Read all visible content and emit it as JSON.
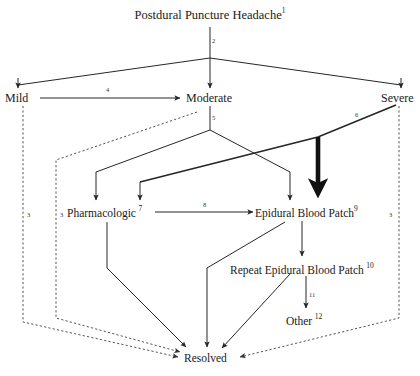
{
  "diagram": {
    "title": "Postdural Puncture Headache",
    "title_sup": "1",
    "nodes": [
      {
        "id": "pdph",
        "label": "Postdural Puncture Headache",
        "sup": "1"
      },
      {
        "id": "mild",
        "label": "Mild",
        "sup": ""
      },
      {
        "id": "moderate",
        "label": "Moderate",
        "sup": ""
      },
      {
        "id": "severe",
        "label": "Severe",
        "sup": ""
      },
      {
        "id": "pharm",
        "label": "Pharmacologic",
        "sup": "7"
      },
      {
        "id": "ebp",
        "label": "Epidural Blood Patch",
        "sup": "9"
      },
      {
        "id": "rebp",
        "label": "Repeat Epidural Blood Patch",
        "sup": "10"
      },
      {
        "id": "other",
        "label": "Other",
        "sup": "12"
      },
      {
        "id": "resolved",
        "label": "Resolved",
        "sup": ""
      }
    ],
    "edge_numbers": [
      {
        "id": "e2",
        "label": "2"
      },
      {
        "id": "e4",
        "label": "4"
      },
      {
        "id": "e5",
        "label": "5"
      },
      {
        "id": "e6",
        "label": "6"
      },
      {
        "id": "e8",
        "label": "8"
      },
      {
        "id": "e11",
        "label": "11"
      },
      {
        "id": "e3a",
        "label": "3"
      },
      {
        "id": "e3b",
        "label": "3"
      },
      {
        "id": "e3c",
        "label": "3"
      }
    ],
    "colors": {
      "stroke": "#262626",
      "dotted": "#555555",
      "text": "#1a1a1a",
      "background": "#ffffff"
    }
  }
}
